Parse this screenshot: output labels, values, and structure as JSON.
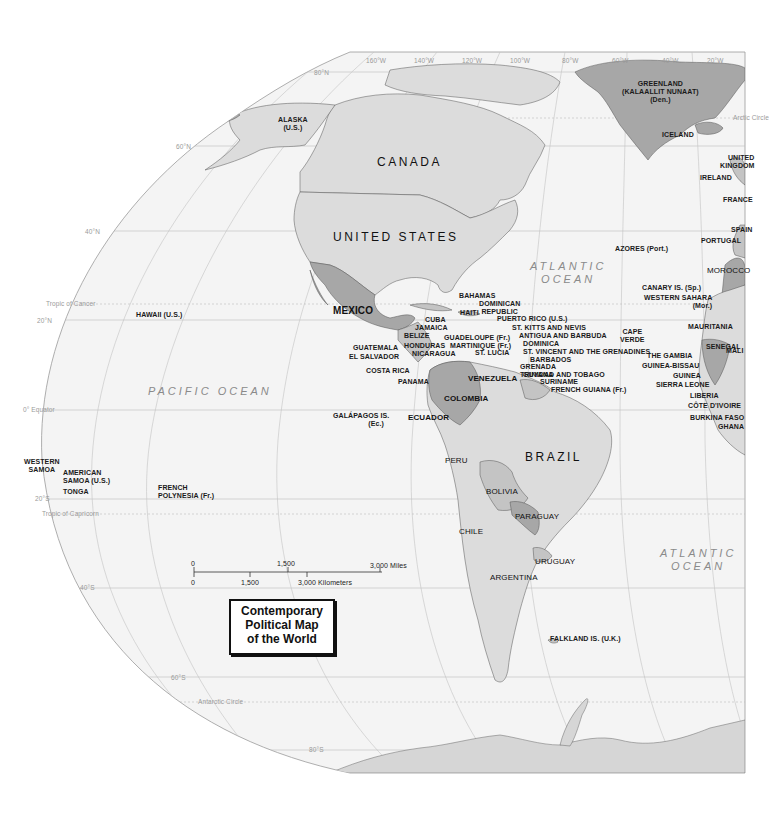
{
  "map": {
    "title_lines": [
      "Contemporary",
      "Political Map",
      "of the World"
    ],
    "colors": {
      "ocean": "#f3f3f3",
      "land_light": "#dcdcdc",
      "land_mid": "#c4c4c4",
      "land_dark": "#a3a3a3",
      "border": "#555555",
      "graticule": "#b8b8b8",
      "background": "#ffffff"
    },
    "graticule_labels": {
      "longitudes": [
        "160°W",
        "140°W",
        "120°W",
        "100°W",
        "80°W",
        "60°W",
        "40°W",
        "20°W"
      ],
      "latitudes": [
        "80°N",
        "60°N",
        "40°N",
        "20°N",
        "0° Equator",
        "20°S",
        "40°S",
        "60°S",
        "80°S"
      ],
      "special_lines": [
        "Arctic Circle",
        "Tropic of Cancer",
        "Tropic of Capricorn",
        "Antarctic Circle"
      ]
    },
    "oceans": [
      {
        "line1": "PACIFIC  OCEAN"
      },
      {
        "line1": "ATLANTIC",
        "line2": "OCEAN"
      },
      {
        "line1": "ATLANTIC",
        "line2": "OCEAN"
      }
    ],
    "countries_major": {
      "canada": "CANADA",
      "united_states": "UNITED STATES",
      "brazil": "BRAZIL",
      "mexico": "MEXICO"
    },
    "labels": {
      "greenland": [
        "GREENLAND",
        "(KALAALLIT NUNAAT)",
        "(Den.)"
      ],
      "iceland": "ICELAND",
      "alaska": [
        "ALASKA",
        "(U.S.)"
      ],
      "united_kingdom": [
        "UNITED",
        "KINGDOM"
      ],
      "ireland": "IRELAND",
      "france": "FRANCE",
      "spain": "SPAIN",
      "portugal": "PORTUGAL",
      "azores": "AZORES (Port.)",
      "morocco": "MOROCCO",
      "canary": "CANARY IS. (Sp.)",
      "western_sahara": [
        "WESTERN SAHARA",
        "(Mor.)"
      ],
      "mauritania": "MAURITANIA",
      "cape_verde": [
        "CAPE",
        "VERDE"
      ],
      "senegal": "SENEGAL",
      "mali": "MALI",
      "gambia": "THE GAMBIA",
      "guinea_bissau": "GUINEA-BISSAU",
      "guinea": "GUINEA",
      "sierra_leone": "SIERRA LEONE",
      "liberia": "LIBERIA",
      "cote_divoire": "CÔTE D'IVOIRE",
      "burkina_faso": "BURKINA FASO",
      "ghana": "GHANA",
      "hawaii": "HAWAII (U.S.)",
      "bahamas": "BAHAMAS",
      "dominican_republic": [
        "DOMINICAN",
        "REPUBLIC"
      ],
      "haiti": "HAITI",
      "cuba": "CUBA",
      "jamaica": "JAMAICA",
      "puerto_rico": "PUERTO RICO (U.S.)",
      "st_kitts": "ST. KITTS AND NEVIS",
      "antigua": "ANTIGUA AND BARBUDA",
      "guadeloupe": "GUADELOUPE (Fr.)",
      "dominica": "DOMINICA",
      "martinique": "MARTINIQUE (Fr.)",
      "st_vincent": "ST. VINCENT AND THE GRENADINES",
      "st_lucia": "ST. LUCIA",
      "barbados": "BARBADOS",
      "grenada": "GRENADA",
      "trinidad": "TRINIDAD AND TOBAGO",
      "belize": "BELIZE",
      "guatemala": "GUATEMALA",
      "honduras": "HONDURAS",
      "el_salvador": "EL SALVADOR",
      "nicaragua": "NICARAGUA",
      "costa_rica": "COSTA RICA",
      "panama": "PANAMA",
      "venezuela": "VENEZUELA",
      "guyana": "GUYANA",
      "suriname": "SURINAME",
      "french_guiana": "FRENCH GUIANA (Fr.)",
      "colombia": "COLOMBIA",
      "ecuador": "ECUADOR",
      "galapagos": [
        "GALÁPAGOS IS.",
        "(Ec.)"
      ],
      "peru": "PERU",
      "bolivia": "BOLIVIA",
      "paraguay": "PARAGUAY",
      "chile": "CHILE",
      "uruguay": "URUGUAY",
      "argentina": "ARGENTINA",
      "falkland": "FALKLAND IS. (U.K.)",
      "western_samoa": [
        "WESTERN",
        "SAMOA"
      ],
      "american_samoa": [
        "AMERICAN",
        "SAMOA (U.S.)"
      ],
      "tonga": "TONGA",
      "french_polynesia": [
        "FRENCH",
        "POLYNESIA (Fr.)"
      ]
    },
    "scale_bar": {
      "miles": [
        "0",
        "1,500",
        "3,000 Miles"
      ],
      "kilometers": [
        "0",
        "1,500",
        "3,000 Kilometers"
      ]
    }
  }
}
